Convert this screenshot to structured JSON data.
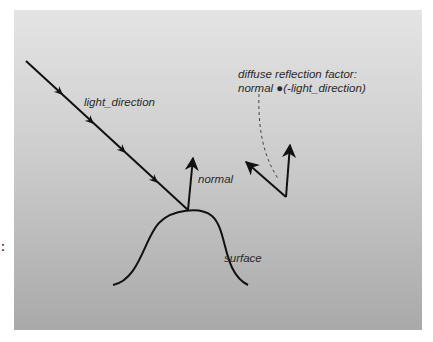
{
  "diagram": {
    "labels": {
      "light_direction": "light_direction",
      "normal": "normal",
      "surface": "surface",
      "factor_line1": "diffuse reflection factor:",
      "factor_line2": "normal ●(-light_direction)"
    },
    "edge_fragment": ":",
    "colors": {
      "background_top": "#e4e4e4",
      "background_bottom": "#a9a9a9",
      "stroke": "#111111",
      "text": "#2a2a2a"
    },
    "elements": [
      {
        "id": "light-ray",
        "type": "arrow-line",
        "from": [
          26,
          61
        ],
        "to": [
          188,
          210
        ],
        "arrowheads": 4
      },
      {
        "id": "surface-normal",
        "type": "arrow",
        "from": [
          188,
          210
        ],
        "to": [
          193,
          158
        ]
      },
      {
        "id": "surface-curve",
        "type": "bump-curve",
        "from": [
          113,
          285
        ],
        "peak": [
          188,
          210
        ],
        "to": [
          248,
          285
        ]
      },
      {
        "id": "inset-normal",
        "type": "arrow",
        "from": [
          286,
          197
        ],
        "to": [
          290,
          145
        ]
      },
      {
        "id": "inset-neg-light",
        "type": "arrow",
        "from": [
          286,
          197
        ],
        "to": [
          246,
          162
        ]
      },
      {
        "id": "inset-angle-pointer",
        "type": "dashed-curve",
        "from": [
          259,
          94
        ],
        "to": [
          279,
          180
        ]
      }
    ]
  }
}
